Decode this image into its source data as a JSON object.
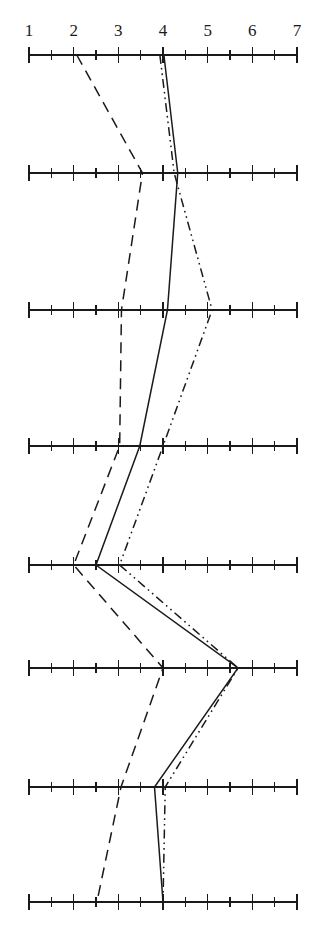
{
  "chart_data": {
    "type": "line",
    "title": "",
    "subtitle": "",
    "xlabel": "",
    "ylabel": "",
    "orientation": "horizontal-profile",
    "xlim": [
      1,
      7
    ],
    "xticks": [
      1,
      2,
      3,
      4,
      5,
      6,
      7
    ],
    "xtick_labels": [
      "1",
      "2",
      "3",
      "4",
      "5",
      "6",
      "7"
    ],
    "minor_ticks_per_interval": 1,
    "grid": false,
    "axis_count": 8,
    "axis_rows": [
      1,
      2,
      3,
      4,
      5,
      6,
      7,
      8
    ],
    "legend": [],
    "legend_position": "none",
    "annotations": [],
    "series": [
      {
        "name": "series-solid",
        "linestyle": "solid",
        "color": "#1a1a1a",
        "values": [
          4.02,
          4.33,
          4.1,
          3.48,
          2.5,
          5.68,
          3.81,
          4.0
        ]
      },
      {
        "name": "series-dashed",
        "linestyle": "dashed",
        "color": "#1a1a1a",
        "values": [
          2.07,
          3.54,
          3.07,
          3.03,
          2.0,
          4.0,
          3.06,
          2.52
        ]
      },
      {
        "name": "series-dash-dot-dot",
        "linestyle": "dashdotdot",
        "color": "#1a1a1a",
        "values": [
          3.93,
          4.25,
          5.1,
          4.0,
          3.03,
          5.68,
          4.05,
          4.0
        ]
      }
    ]
  },
  "geometry": {
    "value_min": 1,
    "value_max": 7,
    "x_at_min": 29,
    "x_at_max": 297,
    "axis_y": [
      55,
      173,
      310,
      446,
      565,
      668,
      787,
      902
    ],
    "tick_half_height": 8,
    "axis_stroke_width": 1.6,
    "series_stroke_width": 1.5,
    "axis_color": "#1a1a1a"
  },
  "tick_labels": {
    "y": 22,
    "items": [
      {
        "text": "1",
        "value": 1
      },
      {
        "text": "2",
        "value": 2
      },
      {
        "text": "3",
        "value": 3
      },
      {
        "text": "4",
        "value": 4
      },
      {
        "text": "5",
        "value": 5
      },
      {
        "text": "6",
        "value": 6
      },
      {
        "text": "7",
        "value": 7
      }
    ]
  }
}
